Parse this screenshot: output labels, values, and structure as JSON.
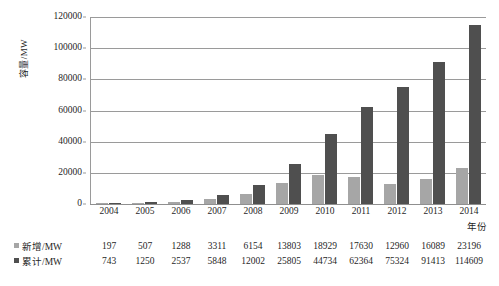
{
  "chart_data": {
    "type": "bar",
    "title": "",
    "xlabel": "年份",
    "ylabel": "容量/MW",
    "categories": [
      "2004",
      "2005",
      "2006",
      "2007",
      "2008",
      "2009",
      "2010",
      "2011",
      "2012",
      "2013",
      "2014"
    ],
    "series": [
      {
        "name": "新增/MW",
        "color": "#a6a6a6",
        "values": [
          197,
          507,
          1288,
          3311,
          6154,
          13803,
          18929,
          17630,
          12960,
          16089,
          23196
        ]
      },
      {
        "name": "累计/MW",
        "color": "#4f4f4f",
        "values": [
          743,
          1250,
          2537,
          5848,
          12002,
          25805,
          44734,
          62364,
          75324,
          91413,
          114609
        ]
      }
    ],
    "ylim": [
      0,
      120000
    ],
    "yticks": [
      "0",
      "20000",
      "40000",
      "60000",
      "80000",
      "100000",
      "120000"
    ],
    "grid": true,
    "legend_position": "bottom-table"
  }
}
